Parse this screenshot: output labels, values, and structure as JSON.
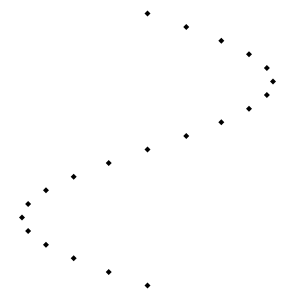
{
  "chart_data": {
    "type": "scatter",
    "title": "",
    "xlabel": "",
    "ylabel": "",
    "marker": "diamond",
    "marker_color": "#000000",
    "background": "#ffffff",
    "axes_visible": false,
    "grid": false,
    "xlim": [
      -1,
      1
    ],
    "ylim": [
      0,
      20
    ],
    "y_direction": "down",
    "series": [
      {
        "name": "points",
        "x": [
          0,
          0.309,
          0.588,
          0.809,
          0.951,
          1.0,
          0.951,
          0.809,
          0.588,
          0.309,
          0,
          -0.309,
          -0.588,
          -0.809,
          -0.951,
          -1.0,
          -0.951,
          -0.809,
          -0.588,
          -0.309,
          0
        ],
        "y": [
          0,
          1,
          2,
          3,
          4,
          5,
          6,
          7,
          8,
          9,
          10,
          11,
          12,
          13,
          14,
          15,
          16,
          17,
          18,
          19,
          20
        ]
      }
    ]
  }
}
